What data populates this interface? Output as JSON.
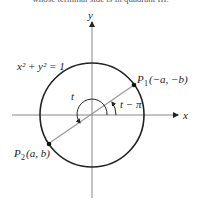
{
  "caption_fragment": "whose terminal side is in quadrant III.",
  "diagram": {
    "axes": {
      "x_label": "x",
      "y_label": "y"
    },
    "equation": "x² + y² = 1",
    "angle_t_label": "t",
    "angle_t_minus_pi_label": "t − π",
    "point_p1": {
      "name": "P",
      "subscript": "1",
      "coords": "(−a, −b)"
    },
    "point_p2": {
      "name": "P",
      "subscript": "2",
      "coords": "(a, b)"
    }
  }
}
